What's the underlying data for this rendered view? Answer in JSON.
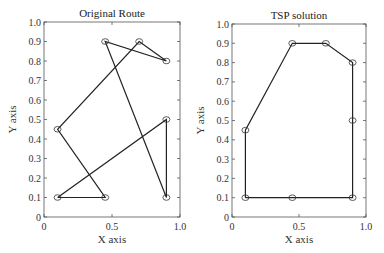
{
  "chart_data": [
    {
      "type": "line",
      "title": "Original Route",
      "xlabel": "X axis",
      "ylabel": "Y axis",
      "xlim": [
        0,
        1.0
      ],
      "ylim": [
        0,
        1.0
      ],
      "xticks": [
        "0",
        "0.5",
        "1.0"
      ],
      "yticks": [
        "0",
        "0.1",
        "0.2",
        "0.3",
        "0.4",
        "0.5",
        "0.6",
        "0.7",
        "0.8",
        "0.9",
        "1.0"
      ],
      "marker": "circle",
      "grid": false,
      "route": [
        [
          0.1,
          0.1
        ],
        [
          0.45,
          0.1
        ],
        [
          0.1,
          0.45
        ],
        [
          0.7,
          0.9
        ],
        [
          0.9,
          0.8
        ],
        [
          0.45,
          0.9
        ],
        [
          0.9,
          0.1
        ],
        [
          0.9,
          0.5
        ],
        [
          0.1,
          0.1
        ]
      ]
    },
    {
      "type": "line",
      "title": "TSP solution",
      "xlabel": "X axis",
      "ylabel": "Y axis",
      "xlim": [
        0,
        1.0
      ],
      "ylim": [
        0,
        1.0
      ],
      "xticks": [
        "0",
        "0.5",
        "1.0"
      ],
      "yticks": [
        "0",
        "0.1",
        "0.2",
        "0.3",
        "0.4",
        "0.5",
        "0.6",
        "0.7",
        "0.8",
        "0.9",
        "1.0"
      ],
      "marker": "circle",
      "grid": false,
      "route": [
        [
          0.1,
          0.1
        ],
        [
          0.1,
          0.45
        ],
        [
          0.45,
          0.9
        ],
        [
          0.7,
          0.9
        ],
        [
          0.9,
          0.8
        ],
        [
          0.9,
          0.5
        ],
        [
          0.9,
          0.1
        ],
        [
          0.45,
          0.1
        ],
        [
          0.1,
          0.1
        ]
      ]
    }
  ],
  "layout": {
    "panels": [
      {
        "x0": 44,
        "x1": 180,
        "ytop": 22,
        "ybot": 217
      },
      {
        "x0": 232,
        "x1": 366,
        "ytop": 24,
        "ybot": 217
      }
    ]
  }
}
